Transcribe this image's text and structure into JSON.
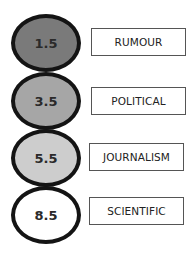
{
  "diagram": {
    "type": "vertical-scale",
    "items": [
      {
        "value": "1.5",
        "label": "RUMOUR",
        "fill": "#7a7a7a"
      },
      {
        "value": "3.5",
        "label": "POLITICAL",
        "fill": "#a6a6a6"
      },
      {
        "value": "5.5",
        "label": "JOURNALISM",
        "fill": "#cdcdcd"
      },
      {
        "value": "8.5",
        "label": "SCIENTIFIC",
        "fill": "#ffffff"
      }
    ],
    "outline_color": "#141414"
  }
}
